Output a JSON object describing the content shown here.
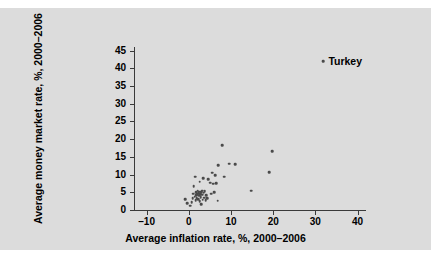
{
  "chart_data": {
    "type": "scatter",
    "title": "",
    "xlabel": "Average inflation rate, %, 2000–2006",
    "ylabel": "Average money market rate, %, 2000–2006",
    "xlim": [
      -13,
      42
    ],
    "ylim": [
      0,
      46
    ],
    "xticks": [
      -10,
      0,
      10,
      20,
      30,
      40
    ],
    "xtick_labels": [
      "–10",
      "0",
      "10",
      "20",
      "30",
      "40"
    ],
    "yticks": [
      0,
      5,
      10,
      15,
      20,
      25,
      30,
      35,
      40,
      45
    ],
    "ytick_labels": [
      "0",
      "5",
      "10",
      "15",
      "20",
      "25",
      "30",
      "35",
      "40",
      "45"
    ],
    "grid": false,
    "legend": null,
    "marker_color": "#4a4a4a",
    "panel_color": "#dcdcdc",
    "axis_color": "#3a3a3a",
    "points": [
      {
        "x": -0.9,
        "y": 3.0
      },
      {
        "x": -0.4,
        "y": 2.0
      },
      {
        "x": 0.3,
        "y": 1.2
      },
      {
        "x": 0.7,
        "y": 2.2
      },
      {
        "x": 0.9,
        "y": 3.4
      },
      {
        "x": 1.1,
        "y": 4.6
      },
      {
        "x": 1.2,
        "y": 6.7
      },
      {
        "x": 1.4,
        "y": 3.8
      },
      {
        "x": 1.6,
        "y": 2.7
      },
      {
        "x": 1.7,
        "y": 4.2
      },
      {
        "x": 1.8,
        "y": 5.1
      },
      {
        "x": 1.9,
        "y": 3.3
      },
      {
        "x": 2.0,
        "y": 4.4
      },
      {
        "x": 2.1,
        "y": 5.5
      },
      {
        "x": 2.2,
        "y": 3.1
      },
      {
        "x": 2.3,
        "y": 4.8
      },
      {
        "x": 2.4,
        "y": 4.0
      },
      {
        "x": 2.5,
        "y": 5.2
      },
      {
        "x": 2.6,
        "y": 2.4
      },
      {
        "x": 2.7,
        "y": 4.5
      },
      {
        "x": 2.8,
        "y": 3.6
      },
      {
        "x": 2.9,
        "y": 5.0
      },
      {
        "x": 3.0,
        "y": 1.6
      },
      {
        "x": 3.1,
        "y": 4.3
      },
      {
        "x": 3.2,
        "y": 5.4
      },
      {
        "x": 3.3,
        "y": 2.9
      },
      {
        "x": 3.5,
        "y": 4.9
      },
      {
        "x": 3.6,
        "y": 3.5
      },
      {
        "x": 3.8,
        "y": 5.3
      },
      {
        "x": 4.0,
        "y": 2.8
      },
      {
        "x": 4.1,
        "y": 4.1
      },
      {
        "x": 1.5,
        "y": 9.4
      },
      {
        "x": 2.6,
        "y": 8.0
      },
      {
        "x": 3.4,
        "y": 9.0
      },
      {
        "x": 4.4,
        "y": 3.3
      },
      {
        "x": 4.6,
        "y": 8.7
      },
      {
        "x": 5.0,
        "y": 7.7
      },
      {
        "x": 5.3,
        "y": 4.6
      },
      {
        "x": 5.6,
        "y": 10.5
      },
      {
        "x": 5.8,
        "y": 7.4
      },
      {
        "x": 6.0,
        "y": 5.1
      },
      {
        "x": 6.3,
        "y": 9.9
      },
      {
        "x": 6.5,
        "y": 7.6
      },
      {
        "x": 6.8,
        "y": 2.6
      },
      {
        "x": 6.9,
        "y": 12.6
      },
      {
        "x": 7.9,
        "y": 18.3
      },
      {
        "x": 8.4,
        "y": 9.4
      },
      {
        "x": 9.5,
        "y": 13.1
      },
      {
        "x": 11.0,
        "y": 13.0
      },
      {
        "x": 14.8,
        "y": 5.4
      },
      {
        "x": 19.1,
        "y": 10.7
      },
      {
        "x": 19.8,
        "y": 16.6
      },
      {
        "x": 31.9,
        "y": 42.0
      }
    ],
    "annotations": [
      {
        "label": "Turkey",
        "x": 31.9,
        "y": 42.0
      }
    ]
  }
}
